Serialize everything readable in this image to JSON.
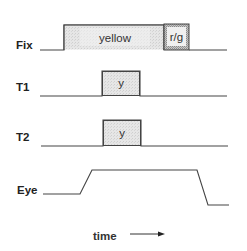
{
  "diagram": {
    "type": "timing-diagram",
    "rows": [
      {
        "label": "Fix",
        "segments": [
          {
            "label": "yellow"
          },
          {
            "label": "r/g"
          }
        ]
      },
      {
        "label": "T1",
        "segments": [
          {
            "label": "y"
          }
        ]
      },
      {
        "label": "T2",
        "segments": [
          {
            "label": "y"
          }
        ]
      },
      {
        "label": "Eye"
      }
    ],
    "time_axis": {
      "label": "time"
    },
    "colors": {
      "line": "#444444",
      "box_fill": "#e4e4e4",
      "rg_fill": "#eeeeee",
      "text": "#222222"
    }
  }
}
